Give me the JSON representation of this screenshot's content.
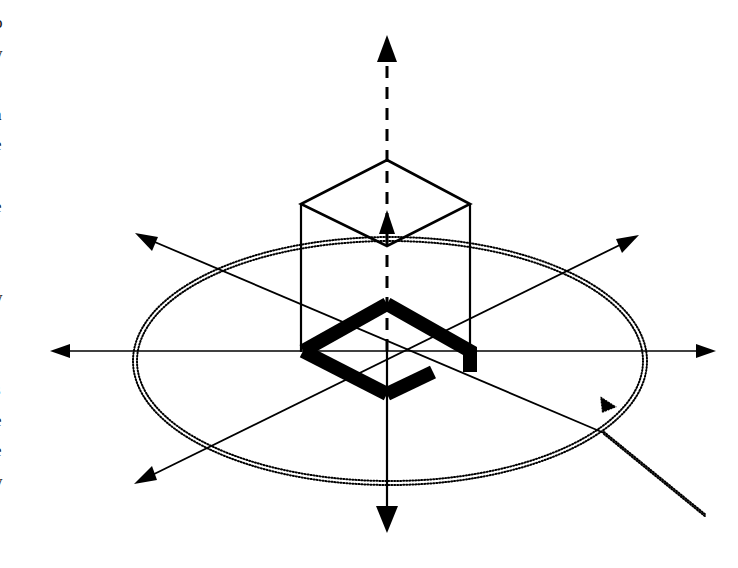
{
  "figure": {
    "type": "technical-line-diagram",
    "background_color": "#ffffff",
    "ink_color": "#000000",
    "canvas": {
      "width": 738,
      "height": 568
    },
    "origin": {
      "x": 387,
      "y": 351
    }
  },
  "axes": [
    {
      "id": "z-axis",
      "label": "",
      "style": "dashed-above-origin-solid-below",
      "line_width": 3,
      "from": {
        "x": 387,
        "y": 532
      },
      "to": {
        "x": 387,
        "y": 35
      },
      "arrowheads": [
        {
          "at": {
            "x": 387,
            "y": 35
          },
          "direction": "up",
          "size": 13,
          "style": "solid"
        },
        {
          "at": {
            "x": 387,
            "y": 210
          },
          "direction": "up",
          "size": 11,
          "style": "solid"
        },
        {
          "at": {
            "x": 387,
            "y": 532
          },
          "direction": "down",
          "size": 13,
          "style": "solid"
        }
      ]
    },
    {
      "id": "horizontal-axis",
      "label": "",
      "style": "solid",
      "line_width": 1.6,
      "from": {
        "x": 50,
        "y": 351
      },
      "to": {
        "x": 716,
        "y": 351
      },
      "arrowheads": [
        {
          "at": {
            "x": 50,
            "y": 351
          },
          "direction": "left",
          "size": 12,
          "style": "solid"
        },
        {
          "at": {
            "x": 716,
            "y": 351
          },
          "direction": "right",
          "size": 12,
          "style": "solid"
        }
      ]
    },
    {
      "id": "diagonal-axis-ne-sw",
      "label": "",
      "style": "solid",
      "line_width": 1.8,
      "from": {
        "x": 134,
        "y": 484
      },
      "to": {
        "x": 639,
        "y": 235
      },
      "arrowheads": [
        {
          "at": {
            "x": 134,
            "y": 484
          },
          "direction": "down-left",
          "size": 12,
          "style": "solid"
        },
        {
          "at": {
            "x": 639,
            "y": 235
          },
          "direction": "up-right",
          "size": 12,
          "style": "solid"
        }
      ]
    },
    {
      "id": "diagonal-axis-nw-se",
      "label": "",
      "style": "solid",
      "line_width": 1.8,
      "from": {
        "x": 135,
        "y": 233
      },
      "to": {
        "x": 602,
        "y": 433
      },
      "arrowheads": [
        {
          "at": {
            "x": 135,
            "y": 233
          },
          "direction": "up-left",
          "size": 12,
          "style": "solid"
        }
      ]
    }
  ],
  "ellipse": {
    "id": "equatorial-plane-ellipse",
    "description": "dotted double-stroke ellipse representing the equatorial plane / radiation circle",
    "center": {
      "x": 390,
      "y": 361
    },
    "rx": 257,
    "ry": 124,
    "stroke_style": "dotted",
    "stroke_width": 2,
    "dash_pattern": "1 2",
    "double_stroke_offset": 3
  },
  "direction_marker": {
    "id": "rotation-arrowhead",
    "description": "small stippled arrowhead on the ellipse indicating direction of travel",
    "at": {
      "x": 607,
      "y": 404
    },
    "direction": "down-left",
    "size": 14,
    "style": "dotted"
  },
  "leader_line": {
    "id": "ellipse-leader-line",
    "description": "dotted leader running from the ellipse down to the lower-right margin",
    "from": {
      "x": 604,
      "y": 432
    },
    "to": {
      "x": 705,
      "y": 514
    },
    "stroke_style": "dotted",
    "stroke_width": 2
  },
  "prism": {
    "id": "hexagonal-prism-box",
    "description": "isometric box / prism above the equatorial plane",
    "stroke_width": 2.6,
    "top_face": {
      "id": "top-diamond-face",
      "vertices": [
        {
          "x": 387,
          "y": 160
        },
        {
          "x": 470,
          "y": 204
        },
        {
          "x": 387,
          "y": 246
        },
        {
          "x": 301,
          "y": 204
        }
      ]
    },
    "side_edges": [
      {
        "from": {
          "x": 301,
          "y": 204
        },
        "to": {
          "x": 301,
          "y": 352
        }
      },
      {
        "from": {
          "x": 470,
          "y": 204
        },
        "to": {
          "x": 470,
          "y": 352
        }
      }
    ]
  },
  "loop_antenna": {
    "id": "thick-loop-antenna",
    "description": "heavy black rhombic loop with a feed gap at the right vertex",
    "stroke_width": 14,
    "vertices": {
      "top": {
        "x": 387,
        "y": 304
      },
      "right": {
        "x": 470,
        "y": 351
      },
      "bottom": {
        "x": 387,
        "y": 394
      },
      "left": {
        "x": 303,
        "y": 351
      }
    },
    "gap": {
      "description": "open feed gap on the right-hand side of the loop",
      "upper_stub_end": {
        "x": 470,
        "y": 372
      },
      "lower_stub_end": {
        "x": 433,
        "y": 372
      }
    }
  },
  "margin_text_column": {
    "description": "clipped sliver of the neighbouring body-text column at the extreme left edge",
    "lines": [
      "o",
      "y",
      "r",
      "a",
      "e",
      "t",
      "e",
      "l",
      "l",
      "y",
      ".",
      ".",
      "s",
      "e",
      "e",
      "y",
      "l"
    ]
  }
}
